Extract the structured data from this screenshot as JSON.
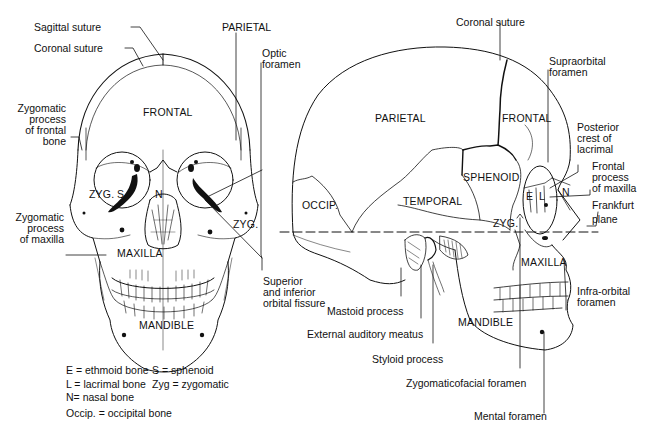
{
  "front_view": {
    "bones": {
      "frontal": "FRONTAL",
      "zyg_left": "ZYG.",
      "sphenoid": "S.",
      "nasal": "N",
      "zyg_right": "ZYG.",
      "maxilla": "MAXILLA",
      "mandible": "MANDIBLE"
    },
    "callouts": {
      "sagittal_suture": "Sagittal suture",
      "coronal_suture": "Coronal suture",
      "parietal": "PARIETAL",
      "optic_foramen": [
        "Optic",
        "foramen"
      ],
      "zygomatic_process_frontal": [
        "Zygomatic",
        "process",
        "of frontal",
        "bone"
      ],
      "zygomatic_process_maxilla": [
        "Zygomatic",
        "process",
        "of maxilla"
      ],
      "orbital_fissure": [
        "Superior",
        "and inferior",
        "orbital fissure"
      ]
    }
  },
  "lateral_view": {
    "bones": {
      "parietal": "PARIETAL",
      "frontal": "FRONTAL",
      "sphenoid": "SPHENOID",
      "temporal": "TEMPORAL",
      "occipital": "OCCIP.",
      "ethmoid": "E",
      "lacrimal": "L",
      "nasal": "N",
      "zygomatic": "ZYG.",
      "maxilla": "MAXILLA",
      "mandible": "MANDIBLE"
    },
    "callouts": {
      "coronal_suture": "Coronal suture",
      "supraorbital_foramen": [
        "Supraorbital",
        "foramen"
      ],
      "posterior_crest_lacrimal": [
        "Posterior",
        "crest of",
        "lacrimal"
      ],
      "frontal_process_maxilla": [
        "Frontal",
        "process",
        "of maxilla"
      ],
      "frankfurt_plane": [
        "Frankfurt",
        "plane"
      ],
      "infraorbital_foramen": [
        "Infra-orbital",
        "foramen"
      ],
      "mastoid_process": "Mastoid process",
      "external_auditory_meatus": "External auditory meatus",
      "styloid_process": "Styloid process",
      "zygomaticofacial_foramen": "Zygomaticofacial  foramen",
      "mental_foramen": "Mental foramen"
    }
  },
  "legend": [
    [
      "E = ethmoid bone",
      "S = sphenoid"
    ],
    [
      "L = lacrimal bone",
      "Zyg = zygomatic"
    ],
    [
      "N= nasal bone",
      ""
    ],
    [
      "Occip. = occipital bone",
      ""
    ]
  ],
  "colors": {
    "ink": "#111111",
    "background": "#ffffff"
  }
}
